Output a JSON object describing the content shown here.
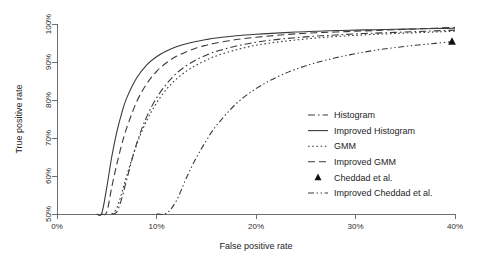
{
  "chart_data": {
    "type": "line",
    "title": "",
    "xlabel": "False positive rate",
    "ylabel": "True positive rate",
    "xlim": [
      0,
      40
    ],
    "ylim": [
      50,
      100
    ],
    "xticks": [
      "0%",
      "10%",
      "20%",
      "30%",
      "40%"
    ],
    "xtick_values": [
      0,
      10,
      20,
      30,
      40
    ],
    "yticks": [
      "50%",
      "60%",
      "70%",
      "80%",
      "90%",
      "100%"
    ],
    "ytick_values": [
      50,
      60,
      70,
      80,
      90,
      100
    ],
    "grid": false,
    "legend_position": "lower-right-inside",
    "x": [
      0,
      2,
      4,
      4.5,
      5,
      5.5,
      6,
      6.5,
      7,
      8,
      9,
      10,
      11,
      12,
      13,
      14,
      15,
      16,
      18,
      20,
      22,
      24,
      26,
      28,
      30,
      32,
      34,
      36,
      38,
      40
    ],
    "series": [
      {
        "name": "Histogram",
        "style": "dashdot",
        "values": [
          50,
          50,
          50,
          50,
          50,
          50,
          50.5,
          54,
          59,
          68.5,
          75.5,
          80.5,
          84.2,
          87,
          89,
          90.6,
          91.8,
          92.8,
          94.2,
          95.2,
          95.9,
          96.4,
          96.8,
          97.1,
          97.4,
          97.6,
          97.8,
          98,
          98.2,
          98.4
        ]
      },
      {
        "name": "Improved Histogram",
        "style": "solid",
        "values": [
          50,
          50,
          50,
          50.2,
          57,
          65,
          71.5,
          76.5,
          80.5,
          85.8,
          89.2,
          91.4,
          92.9,
          94,
          94.8,
          95.4,
          95.9,
          96.3,
          96.9,
          97.3,
          97.6,
          97.9,
          98.1,
          98.3,
          98.4,
          98.5,
          98.6,
          98.7,
          98.8,
          98.9
        ]
      },
      {
        "name": "GMM",
        "style": "dotted",
        "values": [
          50,
          50,
          50,
          50,
          50,
          50,
          51.5,
          55.5,
          60,
          68.2,
          74.5,
          79.2,
          82.8,
          85.5,
          87.6,
          89.2,
          90.5,
          91.6,
          93.2,
          94.4,
          95.2,
          95.8,
          96.3,
          96.7,
          97,
          97.3,
          97.5,
          97.7,
          97.9,
          98.1
        ]
      },
      {
        "name": "Improved GMM",
        "style": "dashed",
        "values": [
          50,
          50,
          50,
          50,
          50.5,
          57,
          63,
          68.2,
          72.6,
          79.5,
          84.2,
          87.5,
          89.8,
          91.5,
          92.7,
          93.7,
          94.4,
          95,
          95.9,
          96.5,
          97,
          97.4,
          97.7,
          97.9,
          98.1,
          98.3,
          98.5,
          98.7,
          98.9,
          99.1
        ]
      },
      {
        "name": "Improved Cheddad et al.",
        "style": "dashdotdot",
        "values": [
          50,
          50,
          50,
          50,
          50,
          50,
          50,
          50,
          50,
          50,
          50,
          50,
          50.2,
          53.5,
          59.5,
          64.8,
          69.3,
          73.2,
          79,
          83,
          85.9,
          88.1,
          89.8,
          91.1,
          92.2,
          93.1,
          93.8,
          94.4,
          94.9,
          95.4
        ]
      }
    ],
    "points": [
      {
        "name": "Cheddad et al.",
        "marker": "triangle",
        "x": 39.7,
        "y": 95.4
      }
    ],
    "legend_entries": [
      {
        "label": "Histogram",
        "style": "dashdot"
      },
      {
        "label": "Improved Histogram",
        "style": "solid"
      },
      {
        "label": "GMM",
        "style": "dotted"
      },
      {
        "label": "Improved GMM",
        "style": "dashed"
      },
      {
        "label": "Cheddad et al.",
        "style": "triangle"
      },
      {
        "label": "Improved Cheddad et al.",
        "style": "dashdotdot"
      }
    ]
  }
}
